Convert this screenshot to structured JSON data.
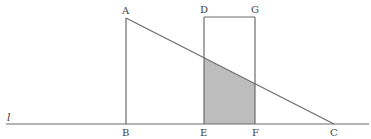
{
  "diagram": {
    "type": "geometry",
    "colors": {
      "stroke": "#6b6b6b",
      "shade": "#bdbdbd",
      "background": "#ffffff",
      "text": "#444444"
    },
    "line_label": "l",
    "points": {
      "A": {
        "label": "A",
        "x": 126,
        "y": 18
      },
      "B": {
        "label": "B",
        "x": 126,
        "y": 124
      },
      "C": {
        "label": "C",
        "x": 334,
        "y": 124
      },
      "D": {
        "label": "D",
        "x": 204,
        "y": 17
      },
      "G": {
        "label": "G",
        "x": 255,
        "y": 17
      },
      "E": {
        "label": "E",
        "x": 204,
        "y": 124
      },
      "F": {
        "label": "F",
        "x": 255,
        "y": 124
      }
    },
    "figures": [
      {
        "name": "right-triangle-ABC",
        "vertices": [
          "A",
          "B",
          "C"
        ]
      },
      {
        "name": "rectangle-DEFG",
        "vertices": [
          "D",
          "E",
          "F",
          "G"
        ]
      },
      {
        "name": "shaded-overlap",
        "description": "region of rectangle DEFG inside triangle ABC"
      }
    ]
  }
}
